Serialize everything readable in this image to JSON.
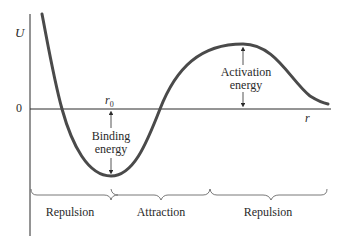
{
  "diagram": {
    "axis": {
      "y_label": "U",
      "x_label": "r",
      "zero_label": "0"
    },
    "markers": {
      "equilibrium_label": "r",
      "equilibrium_subscript": "0"
    },
    "annotations": {
      "binding_energy_line1": "Binding",
      "binding_energy_line2": "energy",
      "activation_energy_line1": "Activation",
      "activation_energy_line2": "energy"
    },
    "regions": [
      {
        "label": "Repulsion"
      },
      {
        "label": "Attraction"
      },
      {
        "label": "Repulsion"
      }
    ],
    "colors": {
      "curve": "#4a4a4a",
      "axis": "#2a2a2a",
      "text": "#2a2a2a",
      "background": "#ffffff"
    }
  }
}
